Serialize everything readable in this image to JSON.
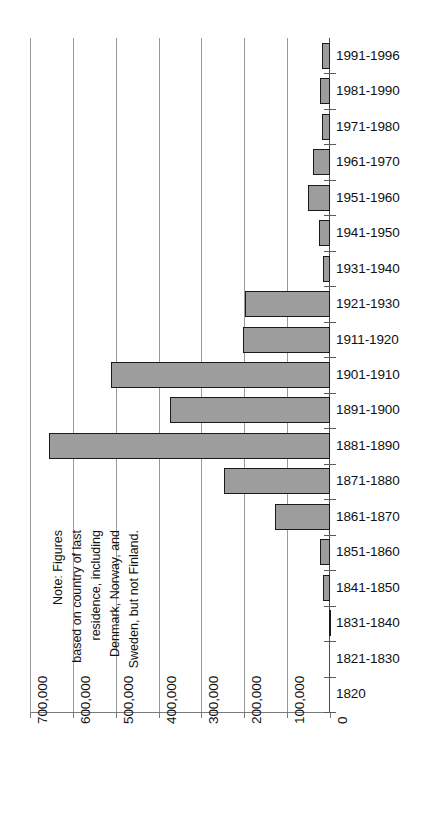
{
  "chart_data": {
    "type": "bar",
    "orientation": "horizontal",
    "title": "",
    "subtitle": "",
    "xlabel": "",
    "ylabel": "",
    "categories": [
      "1991-1996",
      "1981-1990",
      "1971-1980",
      "1961-1970",
      "1951-1960",
      "1941-1950",
      "1931-1940",
      "1921-1930",
      "1911-1920",
      "1901-1910",
      "1891-1900",
      "1881-1890",
      "1871-1880",
      "1861-1870",
      "1851-1860",
      "1841-1850",
      "1831-1840",
      "1821-1830",
      "1820"
    ],
    "values": [
      19000,
      24000,
      19000,
      39000,
      51000,
      26000,
      16000,
      198000,
      203000,
      511000,
      373000,
      655000,
      247000,
      128000,
      23000,
      16000,
      2000,
      0,
      0
    ],
    "xlim": [
      0,
      700000
    ],
    "tick_values": [
      700000,
      600000,
      500000,
      400000,
      300000,
      200000,
      100000,
      0
    ],
    "tick_labels": [
      "700,000",
      "600,000",
      "500,000",
      "400,000",
      "300,000",
      "200,000",
      "100,000",
      "0"
    ],
    "grid": true,
    "legend": false,
    "bar_fill_color": "#9d9d9d",
    "bar_border_color": "#1a1a1a",
    "grid_color": "#9a9a9a",
    "annotations": [
      "Note: Figures",
      "based on country of last",
      "residence, including",
      "Denmark, Norway, and",
      "Sweden, but not Finland."
    ]
  },
  "note": {
    "lines": [
      "Note: Figures",
      "based on country of last",
      "residence, including",
      "Denmark, Norway, and",
      "Sweden, but not Finland."
    ],
    "full_text": "Note: Figures based on country of last residence, including Denmark, Norway, and Sweden, but not Finland."
  }
}
